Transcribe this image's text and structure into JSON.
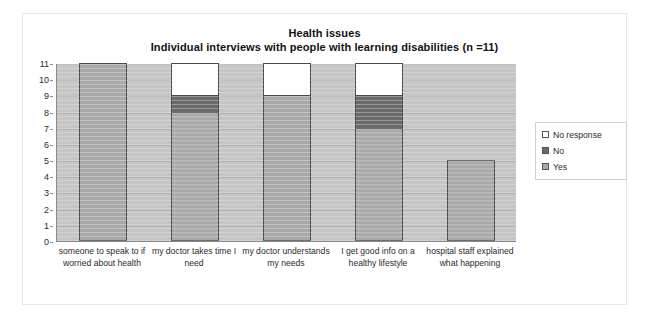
{
  "chart_data": {
    "type": "bar",
    "title": "Health issues",
    "subtitle": "Individual interviews with people with learning disabilities (n =11)",
    "xlabel": "",
    "ylabel": "",
    "ylim": [
      0,
      11
    ],
    "yticks": [
      0,
      1,
      2,
      3,
      4,
      5,
      6,
      7,
      8,
      9,
      10,
      11
    ],
    "grid": true,
    "stacked": true,
    "legend_position": "right",
    "categories": [
      "someone to speak to if worried about health",
      "my doctor takes time I need",
      "my doctor understands my needs",
      "I get good info on a healthy lifestyle",
      "hospital staff explained what happening"
    ],
    "series": [
      {
        "name": "Yes",
        "color": "#a9a9a9",
        "values": [
          11,
          8,
          9,
          7,
          5
        ]
      },
      {
        "name": "No",
        "color": "#6b6b6b",
        "values": [
          0,
          1,
          0,
          2,
          0
        ]
      },
      {
        "name": "No response",
        "color": "#ffffff",
        "values": [
          0,
          2,
          2,
          2,
          0
        ]
      }
    ]
  },
  "legend": {
    "items": [
      {
        "label": "No response",
        "swatch": "#ffffff"
      },
      {
        "label": "No",
        "swatch": "#6b6b6b"
      },
      {
        "label": "Yes",
        "swatch": "#a9a9a9"
      }
    ]
  }
}
